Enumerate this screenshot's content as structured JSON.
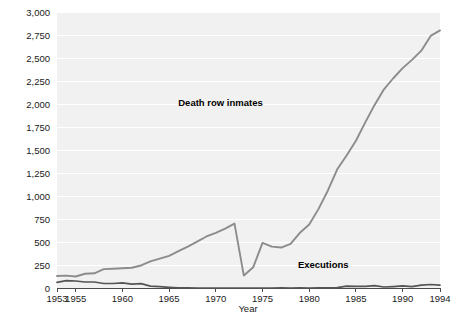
{
  "chart_data": {
    "type": "line",
    "title": "",
    "xlabel": "Year",
    "ylabel": "",
    "xlim": [
      1953,
      1994
    ],
    "ylim": [
      0,
      3000
    ],
    "grid": true,
    "legend_position": "inline-annotation",
    "y_ticks": [
      "0",
      "250",
      "500",
      "750",
      "1,000",
      "1,250",
      "1,500",
      "1,750",
      "2,000",
      "2,250",
      "2,500",
      "2,750",
      "3,000"
    ],
    "y_tick_values": [
      0,
      250,
      500,
      750,
      1000,
      1250,
      1500,
      1750,
      2000,
      2250,
      2500,
      2750,
      3000
    ],
    "x_ticks": [
      "1953",
      "1955",
      "1960",
      "1965",
      "1970",
      "1975",
      "1980",
      "1985",
      "1990",
      "1994"
    ],
    "x_tick_values": [
      1953,
      1955,
      1960,
      1965,
      1970,
      1975,
      1980,
      1985,
      1990,
      1994
    ],
    "x": [
      1953,
      1954,
      1955,
      1956,
      1957,
      1958,
      1959,
      1960,
      1961,
      1962,
      1963,
      1964,
      1965,
      1966,
      1967,
      1968,
      1969,
      1970,
      1971,
      1972,
      1973,
      1974,
      1975,
      1976,
      1977,
      1978,
      1979,
      1980,
      1981,
      1982,
      1983,
      1984,
      1985,
      1986,
      1987,
      1988,
      1989,
      1990,
      1991,
      1992,
      1993,
      1994
    ],
    "series": [
      {
        "name": "Death row inmates",
        "color": "#8c8c8c",
        "values": [
          130,
          135,
          125,
          155,
          160,
          205,
          210,
          215,
          220,
          245,
          290,
          320,
          350,
          400,
          450,
          505,
          560,
          600,
          645,
          700,
          135,
          225,
          490,
          450,
          440,
          480,
          600,
          690,
          860,
          1060,
          1290,
          1440,
          1600,
          1800,
          1990,
          2160,
          2280,
          2390,
          2480,
          2580,
          2740,
          2800
        ]
      },
      {
        "name": "Executions",
        "color": "#555555",
        "values": [
          62,
          81,
          76,
          65,
          65,
          49,
          49,
          56,
          42,
          47,
          21,
          15,
          7,
          1,
          2,
          0,
          0,
          0,
          0,
          0,
          0,
          0,
          0,
          0,
          1,
          0,
          2,
          0,
          1,
          2,
          5,
          21,
          18,
          18,
          25,
          11,
          16,
          23,
          14,
          31,
          38,
          31
        ]
      }
    ],
    "annotations": [
      {
        "text": "Death row inmates",
        "x": 1970.5,
        "y": 1980
      },
      {
        "text": "Executions",
        "x": 1981.5,
        "y": 220
      }
    ]
  },
  "plot": {
    "background_color": "#f1f1f1",
    "gridline_color": "#ffffff",
    "axis_color": "#4a4a4a"
  }
}
